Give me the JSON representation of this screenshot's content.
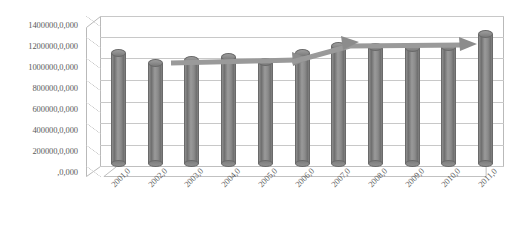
{
  "chart_data": {
    "type": "bar",
    "title": "",
    "subtitle": "",
    "xlabel": "",
    "ylabel": "",
    "categories": [
      "2001,0",
      "2002,0",
      "2003,0",
      "2004,0",
      "2005,0",
      "2006,0",
      "2007,0",
      "2008,0",
      "2009,0",
      "2010,0",
      "2011,0"
    ],
    "values": [
      1105000,
      1010000,
      1035000,
      1060000,
      1015000,
      1105000,
      1165000,
      1160000,
      1150000,
      1155000,
      1280000
    ],
    "series": [
      {
        "name": "",
        "values": [
          1105000,
          1010000,
          1035000,
          1060000,
          1015000,
          1105000,
          1165000,
          1160000,
          1150000,
          1155000,
          1280000
        ]
      }
    ],
    "ylim": [
      0,
      1400000
    ],
    "ytick_values": [
      0,
      200000,
      400000,
      600000,
      800000,
      1000000,
      1200000,
      1400000
    ],
    "ytick_labels": [
      ",0,000",
      "200000,0,000",
      "400000,0,000",
      "600000,0,000",
      "800000,0,000",
      "1000000,0,000",
      "1200000,0,000",
      "1400000,0,000"
    ],
    "grid": true,
    "legend": false,
    "legend_position": "none",
    "style_3d": true,
    "bar_shape": "cylinder",
    "annotations": [
      {
        "name": "trend-arrow-flat",
        "type": "arrow",
        "from_category": "2003,0",
        "to_category": "2006,0",
        "direction": "flat"
      },
      {
        "name": "trend-arrow-rising",
        "type": "arrow",
        "from_category": "2006,0",
        "to_category": "2011,0",
        "direction": "rising"
      }
    ]
  },
  "colors": {
    "bar": "#808080",
    "gridline": "#c8c8c8",
    "axis_text": "#5b5b5b",
    "arrow": "#8c8c8c",
    "background": "#ffffff"
  }
}
